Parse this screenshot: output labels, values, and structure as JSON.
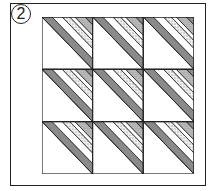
{
  "figure": {
    "label": "2",
    "grid": {
      "rows": 3,
      "cols": 3
    },
    "block": {
      "description": "Half-square triangle block: lower-left triangle plain white; upper-right triangle split into diagonal stripes",
      "stripes": [
        {
          "name": "dark-gray",
          "from": 0.0,
          "to": 0.2,
          "fill": "#8a8a8a"
        },
        {
          "name": "white",
          "from": 0.2,
          "to": 0.4,
          "fill": "#ffffff"
        },
        {
          "name": "light-dots",
          "from": 0.4,
          "to": 0.55,
          "fill": "#dcdcdc"
        },
        {
          "name": "white",
          "from": 0.55,
          "to": 0.65,
          "fill": "#ffffff"
        },
        {
          "name": "dots",
          "from": 0.65,
          "to": 0.85,
          "fill": "#bdbdbd"
        },
        {
          "name": "dark-gray-corner",
          "from": 0.85,
          "to": 1.0,
          "fill": "#8a8a8a"
        }
      ]
    },
    "colors": {
      "line": "#222222",
      "background": "#ffffff"
    }
  }
}
